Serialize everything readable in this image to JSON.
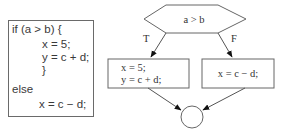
{
  "code": {
    "lines": [
      {
        "text": "if (a > b) {",
        "indent": 0
      },
      {
        "text": "x = 5;",
        "indent": 1
      },
      {
        "text": "y = c + d;",
        "indent": 1
      },
      {
        "text": "}",
        "indent": 1
      },
      {
        "text": "else",
        "indent": 0
      },
      {
        "text": "x = c − d;",
        "indent": 1
      }
    ]
  },
  "flowchart": {
    "decision": {
      "label": "a > b"
    },
    "true_branch": {
      "edge_label": "T",
      "lines": [
        "x = 5;",
        "y = c + d;"
      ]
    },
    "false_branch": {
      "edge_label": "F",
      "lines": [
        "x = c − d;"
      ]
    },
    "join": {
      "shape": "circle",
      "label": ""
    }
  }
}
